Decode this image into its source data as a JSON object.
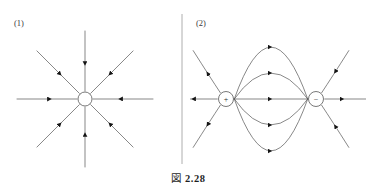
{
  "figure": {
    "caption_label": "図",
    "caption_number": "2.28",
    "background_color": "#ffffff",
    "line_color": "#555555",
    "arrow_color": "#1a1a1a",
    "divider_color": "#9a9a9a"
  },
  "panels": [
    {
      "id": "panel-1",
      "label": "(1)",
      "label_x": 14,
      "label_y": 26,
      "type": "point-charge-radial",
      "charge": {
        "sign": "",
        "cx": 85,
        "cy": 99,
        "r": 7
      },
      "field_lines": {
        "count": 8,
        "length": 68,
        "arrow_direction": "inward",
        "angles_deg": [
          0,
          45,
          90,
          135,
          180,
          225,
          270,
          315
        ],
        "arrow_fraction": 0.45
      }
    },
    {
      "id": "panel-2",
      "label": "(2)",
      "label_x": 196,
      "label_y": 26,
      "type": "electric-dipole",
      "charges": [
        {
          "sign": "+",
          "cx": 226,
          "cy": 99,
          "r": 7.5,
          "name": "positive-charge"
        },
        {
          "sign": "−",
          "cx": 316,
          "cy": 99,
          "r": 7.5,
          "name": "negative-charge"
        }
      ],
      "arc_bulges": [
        -52,
        -26,
        0,
        26,
        52
      ],
      "arrow_direction": "left-to-right",
      "outer_lines": {
        "left_direction": "outward",
        "right_direction": "inward",
        "count_per_side": 2
      }
    }
  ],
  "divider": {
    "x": 182,
    "y_top": 14,
    "y_bottom": 164
  }
}
